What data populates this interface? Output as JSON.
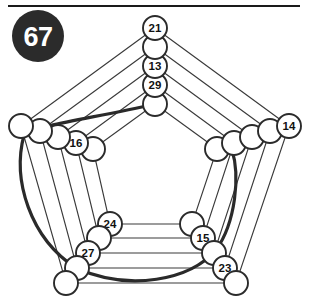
{
  "figure": {
    "badge": {
      "label": "67",
      "shape": "filled-circle",
      "fill_color": "#2b2b2b",
      "text_color": "#ffffff",
      "cx": 38,
      "cy": 36,
      "r": 26
    },
    "top_rule": {
      "x1": 8,
      "y1": 6,
      "x2": 300,
      "y2": 6,
      "color": "#1a1a1a"
    },
    "canvas": {
      "width": 310,
      "height": 305,
      "background": "#ffffff"
    },
    "style": {
      "edge_color": "#3a3a3a",
      "node_fill": "#ffffff",
      "node_stroke": "#2b2b2b",
      "arc_color": "#2a2a2a"
    },
    "rings": [
      {
        "index": 0,
        "name": "outer-ring"
      },
      {
        "index": 1,
        "name": "ring-2"
      },
      {
        "index": 2,
        "name": "ring-3"
      },
      {
        "index": 3,
        "name": "ring-4"
      },
      {
        "index": 4,
        "name": "inner-ring"
      }
    ],
    "corners": [
      "top",
      "upper-left",
      "upper-right",
      "lower-left",
      "lower-right"
    ],
    "nodes": [
      {
        "id": "t0",
        "corner": "top",
        "ring": 0,
        "cx": 155,
        "cy": 28,
        "r": 12,
        "label": "21"
      },
      {
        "id": "t1",
        "corner": "top",
        "ring": 1,
        "cx": 155,
        "cy": 47,
        "r": 12,
        "label": ""
      },
      {
        "id": "t2",
        "corner": "top",
        "ring": 2,
        "cx": 155,
        "cy": 66,
        "r": 12,
        "label": "13"
      },
      {
        "id": "t3",
        "corner": "top",
        "ring": 3,
        "cx": 155,
        "cy": 85,
        "r": 12,
        "label": "29"
      },
      {
        "id": "t4",
        "corner": "top",
        "ring": 4,
        "cx": 155,
        "cy": 104,
        "r": 12,
        "label": ""
      },
      {
        "id": "l0",
        "corner": "upper-left",
        "ring": 0,
        "cx": 21,
        "cy": 126,
        "r": 12,
        "label": ""
      },
      {
        "id": "l1",
        "corner": "upper-left",
        "ring": 1,
        "cx": 40,
        "cy": 131,
        "r": 12,
        "label": ""
      },
      {
        "id": "l2",
        "corner": "upper-left",
        "ring": 2,
        "cx": 58,
        "cy": 137,
        "r": 12,
        "label": ""
      },
      {
        "id": "l3",
        "corner": "upper-left",
        "ring": 3,
        "cx": 76,
        "cy": 143,
        "r": 12,
        "label": "16"
      },
      {
        "id": "l4",
        "corner": "upper-left",
        "ring": 4,
        "cx": 93,
        "cy": 149,
        "r": 12,
        "label": ""
      },
      {
        "id": "r0",
        "corner": "upper-right",
        "ring": 0,
        "cx": 289,
        "cy": 126,
        "r": 12,
        "label": "14"
      },
      {
        "id": "r1",
        "corner": "upper-right",
        "ring": 1,
        "cx": 270,
        "cy": 131,
        "r": 12,
        "label": ""
      },
      {
        "id": "r2",
        "corner": "upper-right",
        "ring": 2,
        "cx": 252,
        "cy": 137,
        "r": 12,
        "label": ""
      },
      {
        "id": "r3",
        "corner": "upper-right",
        "ring": 3,
        "cx": 234,
        "cy": 143,
        "r": 12,
        "label": ""
      },
      {
        "id": "r4",
        "corner": "upper-right",
        "ring": 4,
        "cx": 217,
        "cy": 149,
        "r": 12,
        "label": ""
      },
      {
        "id": "bl0",
        "corner": "lower-left",
        "ring": 0,
        "cx": 66,
        "cy": 283,
        "r": 12,
        "label": ""
      },
      {
        "id": "bl1",
        "corner": "lower-left",
        "ring": 1,
        "cx": 77,
        "cy": 268,
        "r": 12,
        "label": ""
      },
      {
        "id": "bl2",
        "corner": "lower-left",
        "ring": 2,
        "cx": 88,
        "cy": 253,
        "r": 12,
        "label": "27"
      },
      {
        "id": "bl3",
        "corner": "lower-left",
        "ring": 3,
        "cx": 99,
        "cy": 238,
        "r": 12,
        "label": ""
      },
      {
        "id": "bl4",
        "corner": "lower-left",
        "ring": 4,
        "cx": 110,
        "cy": 224,
        "r": 12,
        "label": "24"
      },
      {
        "id": "br0",
        "corner": "lower-right",
        "ring": 0,
        "cx": 236,
        "cy": 283,
        "r": 12,
        "label": ""
      },
      {
        "id": "br1",
        "corner": "lower-right",
        "ring": 1,
        "cx": 225,
        "cy": 268,
        "r": 12,
        "label": "23"
      },
      {
        "id": "br2",
        "corner": "lower-right",
        "ring": 2,
        "cx": 214,
        "cy": 253,
        "r": 12,
        "label": ""
      },
      {
        "id": "br3",
        "corner": "lower-right",
        "ring": 3,
        "cx": 203,
        "cy": 238,
        "r": 12,
        "label": "15"
      },
      {
        "id": "br4",
        "corner": "lower-right",
        "ring": 4,
        "cx": 192,
        "cy": 224,
        "r": 12,
        "label": ""
      }
    ],
    "visible_labels": [
      "67",
      "21",
      "13",
      "29",
      "16",
      "14",
      "24",
      "27",
      "15",
      "23"
    ],
    "edges": [
      [
        "t0",
        "l0"
      ],
      [
        "t0",
        "r0"
      ],
      [
        "l0",
        "bl0"
      ],
      [
        "r0",
        "br0"
      ],
      [
        "bl0",
        "br0"
      ],
      [
        "t1",
        "l1"
      ],
      [
        "t1",
        "r1"
      ],
      [
        "l1",
        "bl1"
      ],
      [
        "r1",
        "br1"
      ],
      [
        "bl1",
        "br1"
      ],
      [
        "t2",
        "l2"
      ],
      [
        "t2",
        "r2"
      ],
      [
        "l2",
        "bl2"
      ],
      [
        "r2",
        "br2"
      ],
      [
        "bl2",
        "br2"
      ],
      [
        "t3",
        "l3"
      ],
      [
        "t3",
        "r3"
      ],
      [
        "l3",
        "bl3"
      ],
      [
        "r3",
        "br3"
      ],
      [
        "bl3",
        "br3"
      ],
      [
        "t4",
        "l4"
      ],
      [
        "t4",
        "r4"
      ],
      [
        "l4",
        "bl4"
      ],
      [
        "r4",
        "br4"
      ],
      [
        "bl4",
        "br4"
      ]
    ],
    "arc": {
      "name": "heavy-sweep-arc",
      "from_node": "t4",
      "to_node": "r3",
      "path": "M 155 104 C 96 118 40 124 24 135 C 12 180 30 238 76 268 C 130 292 190 280 216 250 C 236 222 240 175 232 150"
    }
  }
}
